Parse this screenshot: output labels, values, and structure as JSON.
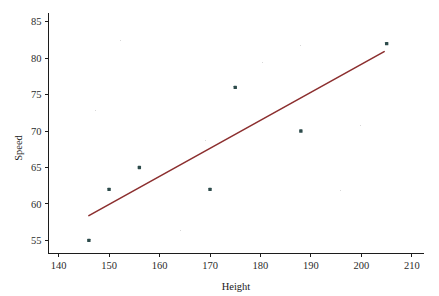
{
  "chart_data": {
    "type": "scatter",
    "title": "",
    "subtitle": "",
    "xlabel": "Height",
    "ylabel": "Speed",
    "xlim": [
      138,
      212
    ],
    "ylim": [
      53.2,
      86.2
    ],
    "xticks": [
      140,
      150,
      160,
      170,
      180,
      190,
      200,
      210
    ],
    "yticks": [
      55,
      60,
      65,
      70,
      75,
      80,
      85
    ],
    "grid": false,
    "legend": false,
    "legend_position": "none",
    "series": [
      {
        "name": "observations",
        "type": "scatter",
        "marker": "square",
        "color": "#2d4b4b",
        "points": [
          {
            "x": 146,
            "y": 55
          },
          {
            "x": 150,
            "y": 62
          },
          {
            "x": 156,
            "y": 65
          },
          {
            "x": 170,
            "y": 62
          },
          {
            "x": 175,
            "y": 76
          },
          {
            "x": 188,
            "y": 70
          },
          {
            "x": 205,
            "y": 82
          }
        ]
      },
      {
        "name": "regression-line",
        "type": "line",
        "color": "#8c2f2f",
        "endpoints": [
          {
            "x": 146,
            "y": 58.4
          },
          {
            "x": 204.5,
            "y": 80.9
          }
        ]
      }
    ],
    "x_values": [
      146,
      150,
      156,
      170,
      175,
      188,
      205
    ],
    "y_values": [
      55,
      62,
      65,
      62,
      76,
      70,
      82
    ]
  },
  "axes": {
    "x_title": "Height",
    "y_title": "Speed",
    "x_tick_labels": [
      "140",
      "150",
      "160",
      "170",
      "180",
      "190",
      "200",
      "210"
    ],
    "y_tick_labels": [
      "55",
      "60",
      "65",
      "70",
      "75",
      "80",
      "85"
    ]
  },
  "colors": {
    "point": "#2d4b4b",
    "line": "#8c2f2f",
    "axis": "#1c1c1c",
    "background": "#ffffff",
    "text": "#1a1a1a"
  }
}
